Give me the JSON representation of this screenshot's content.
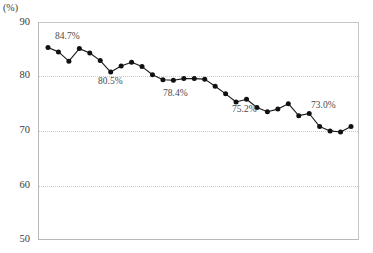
{
  "chart_data": {
    "type": "line",
    "title": "",
    "xlabel": "",
    "ylabel": "",
    "unit_label": "(%)",
    "ylim": [
      50,
      90
    ],
    "yticks": [
      90,
      80,
      70,
      60,
      50
    ],
    "ytick_labels": [
      "90",
      "80",
      "70",
      "60",
      "50"
    ],
    "grid": "horizontal dotted at 80, 70, 60",
    "legend": "none",
    "marker": "filled-circle",
    "line_color": "#1a1a1a",
    "marker_color": "#111111",
    "grid_color": "#c9c9c9",
    "frame_color": "#b9b9b9",
    "x": [
      1,
      2,
      3,
      4,
      5,
      6,
      7,
      8,
      9,
      10,
      11,
      12,
      13,
      14,
      15,
      16,
      17,
      18,
      19,
      20,
      21,
      22,
      23,
      24,
      25,
      26,
      27,
      28,
      29,
      30
    ],
    "values": [
      85.5,
      84.7,
      83.0,
      85.3,
      84.5,
      83.1,
      81.0,
      82.1,
      82.8,
      82.0,
      80.5,
      79.6,
      79.5,
      79.8,
      79.8,
      79.7,
      78.4,
      77.0,
      75.5,
      76.0,
      74.5,
      73.7,
      74.2,
      75.2,
      73.0,
      73.4,
      71.0,
      70.2,
      70.0,
      71.0
    ],
    "annotations": [
      {
        "text": "84.7%",
        "x_index": 2,
        "value": 84.7
      },
      {
        "text": "80.5%",
        "x_index": 11,
        "value": 80.5
      },
      {
        "text": "78.4%",
        "x_index": 17,
        "value": 78.4
      },
      {
        "text": "75.2%",
        "x_index": 24,
        "value": 75.2
      },
      {
        "text": "73.0%",
        "x_index": 25,
        "value": 73.0
      }
    ]
  },
  "annotation_labels": {
    "a1": "84.7%",
    "a2": "80.5%",
    "a3": "78.4%",
    "a4": "75.2%",
    "a5": "73.0%"
  },
  "axis": {
    "unit": "(%)",
    "t90": "90",
    "t80": "80",
    "t70": "70",
    "t60": "60",
    "t50": "50"
  }
}
